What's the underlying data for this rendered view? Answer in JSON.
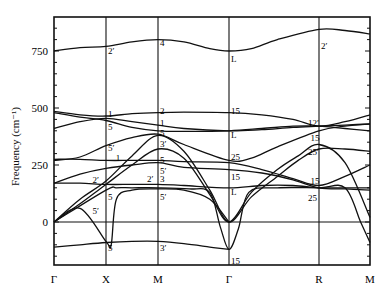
{
  "chart_data": {
    "type": "line",
    "title": "",
    "xlabel": "",
    "ylabel": "Frequency (cm⁻¹)",
    "ylim": [
      -190,
      900
    ],
    "yticks": [
      0,
      250,
      500,
      750
    ],
    "grid": false,
    "k_points": [
      "Γ",
      "X",
      "M",
      "Γ",
      "R",
      "M"
    ],
    "k_positions": [
      0,
      1,
      2,
      3.37,
      5.1,
      6.08
    ],
    "branches": [
      {
        "name": "top",
        "x": [
          0,
          0.5,
          1,
          1.5,
          2,
          2.5,
          3,
          3.37,
          3.8,
          4.3,
          5.1,
          5.6,
          6.08
        ],
        "y": [
          750,
          765,
          770,
          790,
          800,
          790,
          760,
          750,
          760,
          800,
          845,
          840,
          825
        ]
      },
      {
        "name": "b1",
        "x": [
          0,
          0.5,
          1,
          1.5,
          2,
          2.5,
          3.37,
          4,
          4.6,
          5.1,
          5.6,
          6.08
        ],
        "y": [
          485,
          470,
          465,
          475,
          480,
          482,
          480,
          470,
          450,
          420,
          440,
          470
        ]
      },
      {
        "name": "b2",
        "x": [
          0,
          0.5,
          1,
          1.5,
          2,
          2.5,
          3.37,
          4,
          4.6,
          5.1,
          5.6,
          6.08
        ],
        "y": [
          410,
          440,
          455,
          440,
          425,
          410,
          400,
          405,
          415,
          420,
          425,
          430
        ]
      },
      {
        "name": "b3",
        "x": [
          0,
          0.5,
          1,
          1.5,
          2,
          2.5,
          3.37,
          4,
          4.6,
          5.1,
          5.6,
          6.08
        ],
        "y": [
          480,
          460,
          445,
          415,
          400,
          398,
          400,
          410,
          420,
          420,
          410,
          400
        ]
      },
      {
        "name": "b4",
        "x": [
          0,
          0.5,
          1,
          1.5,
          2,
          2.5,
          3.37,
          3.8,
          4.3,
          5.1,
          5.6,
          6.08
        ],
        "y": [
          270,
          285,
          335,
          370,
          385,
          340,
          270,
          280,
          330,
          400,
          420,
          430
        ]
      },
      {
        "name": "b5",
        "x": [
          0,
          0.5,
          1,
          1.5,
          2,
          2.5,
          3.37,
          4,
          4.6,
          5.1,
          5.6,
          6.08
        ],
        "y": [
          275,
          275,
          270,
          270,
          270,
          265,
          260,
          230,
          190,
          160,
          200,
          250
        ]
      },
      {
        "name": "b6",
        "x": [
          0,
          0.5,
          1,
          1.5,
          2,
          2.5,
          3.37,
          4,
          4.6,
          5.1,
          5.6,
          6.08
        ],
        "y": [
          170,
          210,
          235,
          250,
          260,
          240,
          230,
          215,
          185,
          150,
          145,
          140
        ]
      },
      {
        "name": "b7",
        "x": [
          0,
          0.5,
          1,
          1.5,
          2,
          2.5,
          3.37,
          4,
          4.6,
          5.1,
          5.6,
          6.08
        ],
        "y": [
          170,
          170,
          165,
          165,
          165,
          160,
          150,
          160,
          160,
          150,
          150,
          150
        ]
      },
      {
        "name": "b8",
        "x": [
          0,
          0.5,
          1,
          1.5,
          2,
          2.5,
          3,
          3.37,
          3.8,
          4.3,
          4.7,
          5.1,
          5.6,
          6.08
        ],
        "y": [
          0,
          80,
          165,
          250,
          320,
          280,
          120,
          0,
          130,
          230,
          290,
          340,
          260,
          20
        ]
      },
      {
        "name": "b9",
        "x": [
          0,
          0.5,
          1,
          1.5,
          2,
          2.5,
          3,
          3.37,
          3.8,
          4.3,
          4.7,
          5.1,
          5.6,
          6.08
        ],
        "y": [
          0,
          100,
          180,
          290,
          380,
          310,
          140,
          0,
          110,
          200,
          270,
          320,
          320,
          310
        ]
      },
      {
        "name": "b10",
        "x": [
          0,
          1,
          1.2,
          1.5,
          2,
          2.6,
          3.0,
          3.2,
          3.37,
          3.55,
          3.75,
          4.3,
          5.1,
          5.6,
          5.9,
          6.08
        ],
        "y": [
          0,
          140,
          150,
          150,
          150,
          145,
          130,
          -20,
          -120,
          -30,
          130,
          150,
          150,
          150,
          0,
          -90
        ]
      },
      {
        "name": "b11",
        "x": [
          0,
          0.5,
          1,
          1.1,
          1.2,
          1.5,
          2,
          2.5,
          3.0,
          3.37
        ],
        "y": [
          0,
          60,
          -85,
          -100,
          100,
          140,
          145,
          140,
          100,
          0
        ]
      },
      {
        "name": "bottom",
        "x": [
          0,
          0.5,
          1,
          1.5,
          2,
          2.5,
          3,
          3.37
        ],
        "y": [
          -110,
          -100,
          -90,
          -85,
          -85,
          -95,
          -110,
          -120
        ]
      }
    ],
    "annotations": [
      {
        "text": "2′",
        "k": 1,
        "f": 755
      },
      {
        "text": "4",
        "k": 2,
        "f": 790
      },
      {
        "text": "L",
        "k": 3.37,
        "f": 720
      },
      {
        "text": "2′",
        "k": 5.1,
        "f": 775
      },
      {
        "text": "1",
        "k": 1,
        "f": 480
      },
      {
        "text": "5",
        "k": 1,
        "f": 420
      },
      {
        "text": "5′",
        "k": 1,
        "f": 330
      },
      {
        "text": "1",
        "k": 1.15,
        "f": 285
      },
      {
        "text": "2′",
        "k": 0.7,
        "f": 190
      },
      {
        "text": "5′",
        "k": 0.7,
        "f": 55
      },
      {
        "text": "5",
        "k": 1,
        "f": 115
      },
      {
        "text": "5",
        "k": 1,
        "f": -110
      },
      {
        "text": "2",
        "k": 2,
        "f": 490
      },
      {
        "text": "1",
        "k": 2,
        "f": 440
      },
      {
        "text": "5",
        "k": 2,
        "f": 395
      },
      {
        "text": "3′",
        "k": 2,
        "f": 345
      },
      {
        "text": "5",
        "k": 2,
        "f": 275
      },
      {
        "text": "5′",
        "k": 2,
        "f": 230
      },
      {
        "text": "2′",
        "k": 1.75,
        "f": 195
      },
      {
        "text": "3",
        "k": 2,
        "f": 195
      },
      {
        "text": "5′",
        "k": 2,
        "f": 115
      },
      {
        "text": "3′",
        "k": 2,
        "f": -110
      },
      {
        "text": "15",
        "k": 3.37,
        "f": 490
      },
      {
        "text": "L",
        "k": 3.37,
        "f": 385
      },
      {
        "text": "25",
        "k": 3.37,
        "f": 290
      },
      {
        "text": "15",
        "k": 3.37,
        "f": 200
      },
      {
        "text": "L",
        "k": 3.37,
        "f": 135
      },
      {
        "text": "15",
        "k": 3.37,
        "f": -165
      },
      {
        "text": "12′",
        "k": 4.85,
        "f": 440
      },
      {
        "text": "15",
        "k": 4.9,
        "f": 375
      },
      {
        "text": "25′",
        "k": 4.85,
        "f": 310
      },
      {
        "text": "15",
        "k": 4.9,
        "f": 185
      },
      {
        "text": "25",
        "k": 4.85,
        "f": 110
      }
    ]
  },
  "axis": {
    "ylabel": "Frequency (cm⁻¹)",
    "ytick_labels": [
      "750",
      "500",
      "250",
      "0"
    ],
    "xtick_labels": [
      "Γ",
      "X",
      "M",
      "Γ",
      "R",
      "M"
    ]
  }
}
